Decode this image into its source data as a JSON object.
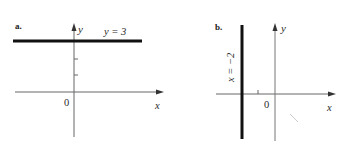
{
  "figure": {
    "panels": [
      {
        "label": "a.",
        "equation": "y = 3",
        "x_axis_label": "x",
        "y_axis_label": "y",
        "origin_label": "0",
        "line": {
          "orientation": "horizontal",
          "value": 3
        }
      },
      {
        "label": "b.",
        "equation": "x = −2",
        "x_axis_label": "x",
        "y_axis_label": "y",
        "origin_label": "0",
        "line": {
          "orientation": "vertical",
          "value": -2
        }
      }
    ],
    "colors": {
      "axis": "#555555",
      "line": "#111111",
      "text": "#2a2a2a"
    }
  }
}
